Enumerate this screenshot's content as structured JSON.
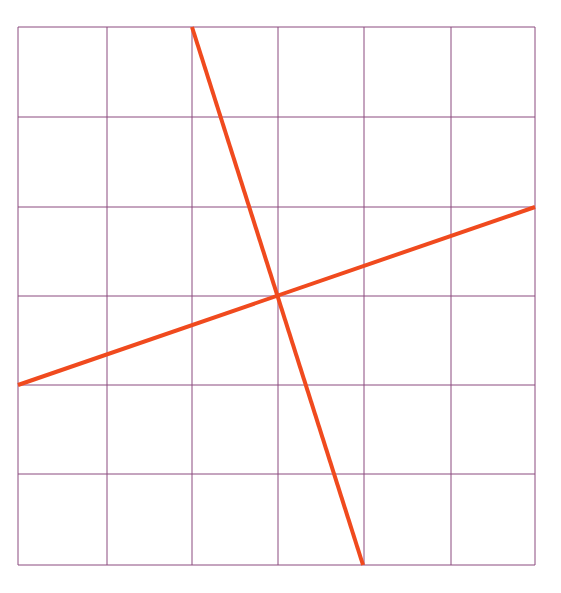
{
  "canvas": {
    "width": 561,
    "height": 593,
    "background": "#ffffff"
  },
  "grid": {
    "columns": 6,
    "rows": 6,
    "x_lines": [
      18,
      107,
      192,
      278,
      364,
      451,
      535
    ],
    "y_lines": [
      27,
      117,
      207,
      296,
      385,
      474,
      565
    ],
    "color": "#8b4a7e",
    "stroke_width": 1
  },
  "lines": [
    {
      "name": "steep-line",
      "x1": 192,
      "y1": 27,
      "x2": 363,
      "y2": 565,
      "color": "#f04a1e",
      "stroke_width": 4
    },
    {
      "name": "shallow-line",
      "x1": 18,
      "y1": 385,
      "x2": 535,
      "y2": 207,
      "color": "#f04a1e",
      "stroke_width": 4
    }
  ],
  "intersection": {
    "x": 278,
    "y": 296
  }
}
